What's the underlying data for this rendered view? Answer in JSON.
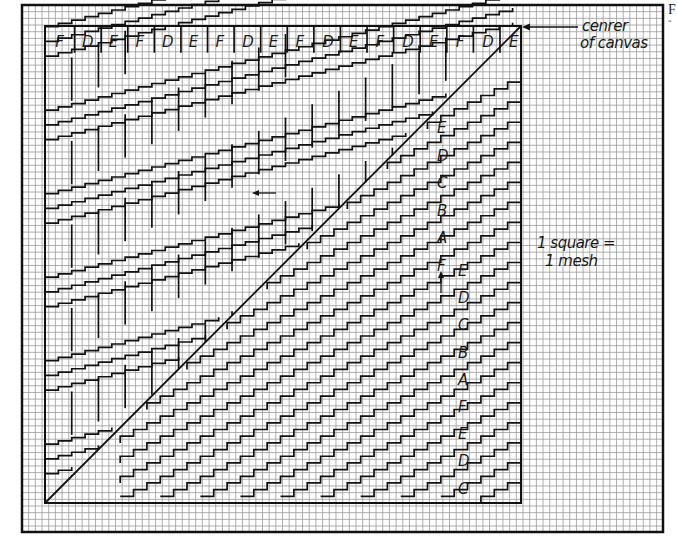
{
  "figure": {
    "grid": {
      "square_px": 6.68,
      "outer_border": {
        "x": 22,
        "y": 5,
        "w": 641,
        "h": 527
      },
      "inner_box": {
        "x": 45,
        "y": 26,
        "w": 476,
        "h": 477
      },
      "grid_color": "#9a9a9a",
      "line_color": "#111111"
    },
    "top_row_letters": [
      "F",
      "D",
      "E",
      "F",
      "D",
      "E",
      "F",
      "D",
      "E",
      "F",
      "D",
      "E",
      "F",
      "D",
      "E",
      "F",
      "D",
      "E"
    ],
    "right_column_1_letters": [
      "E",
      "D",
      "C",
      "B",
      "A",
      "F"
    ],
    "right_column_2_letters": [
      "E",
      "D",
      "C",
      "B",
      "A",
      "F",
      "E",
      "D",
      "C"
    ],
    "annotations": {
      "center_label_line1": "cenrer",
      "center_label_line2": "of canvas",
      "scale_line1": "1 square =",
      "scale_line2": "1 mesh",
      "left_arrow": "direction-left",
      "up_arrow": "direction-up"
    },
    "corner_text": "F",
    "corner_subtext": "“"
  }
}
